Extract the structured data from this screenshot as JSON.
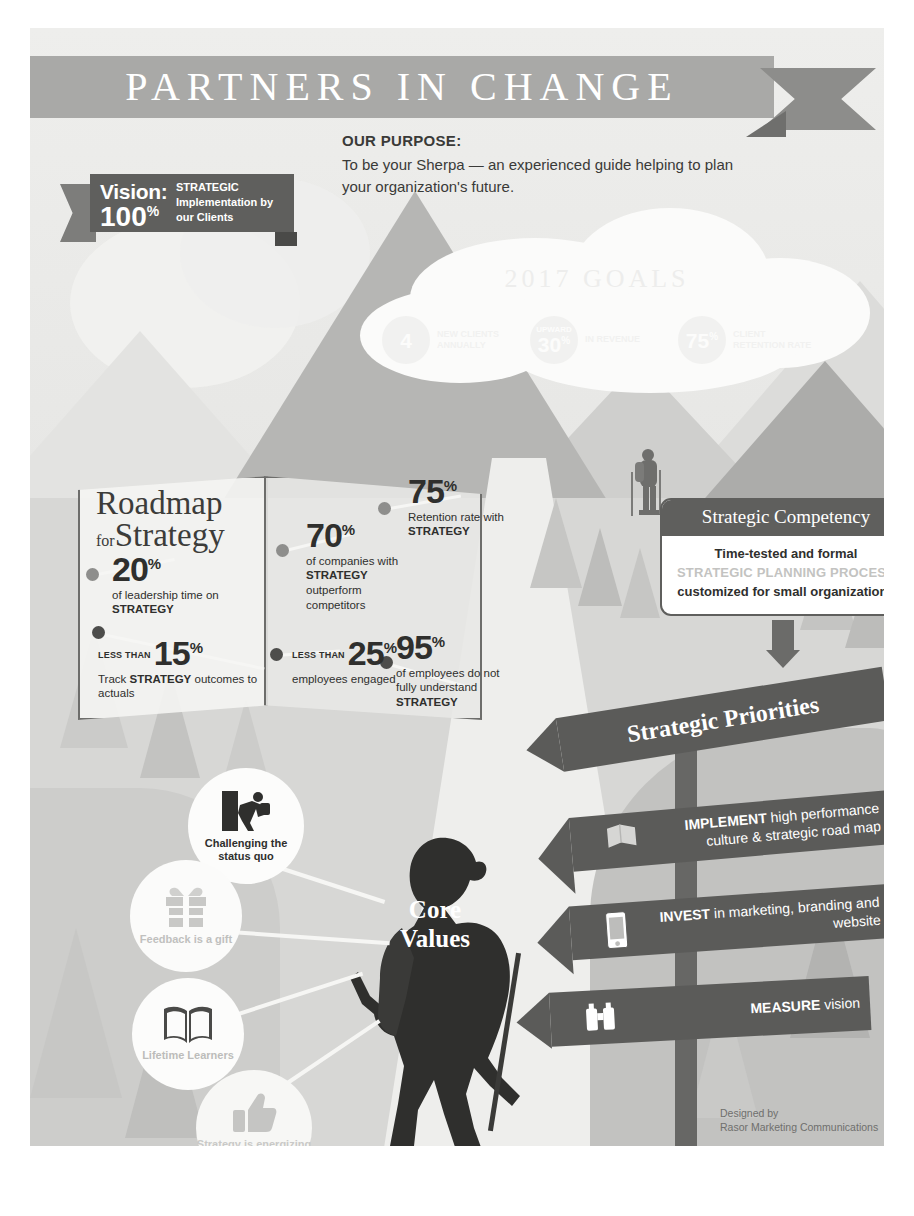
{
  "header": {
    "title": "PARTNERS IN CHANGE"
  },
  "purpose": {
    "title": "OUR PURPOSE:",
    "body": "To be your Sherpa — an experienced guide helping to plan your organization's future."
  },
  "vision": {
    "word": "Vision:",
    "number": "100",
    "unit": "%",
    "description": "STRATEGIC Implementation by our Clients"
  },
  "goals": {
    "title": "2017 GOALS",
    "items": [
      {
        "top": "",
        "number": "4",
        "unit": "",
        "text": "NEW CLIENTS ANNUALLY"
      },
      {
        "top": "UPWARD",
        "number": "30",
        "unit": "%",
        "text": "IN REVENUE"
      },
      {
        "top": "",
        "number": "75",
        "unit": "%",
        "text": "CLIENT RETENTION RATE"
      }
    ]
  },
  "roadmap": {
    "title_line1": "Roadmap",
    "title_small": "for",
    "title_line2": "Strategy",
    "stats": [
      {
        "prefix": "",
        "number": "20",
        "unit": "%",
        "caption_pre": "of leadership time on ",
        "caption_bold": "STRATEGY",
        "caption_post": ""
      },
      {
        "prefix": "",
        "number": "70",
        "unit": "%",
        "caption_pre": "of companies with ",
        "caption_bold": "STRATEGY",
        "caption_post": " outperform competitors"
      },
      {
        "prefix": "",
        "number": "75",
        "unit": "%",
        "caption_pre": "Retention rate with ",
        "caption_bold": "STRATEGY",
        "caption_post": ""
      },
      {
        "prefix": "LESS THAN",
        "number": "15",
        "unit": "%",
        "caption_pre": "Track ",
        "caption_bold": "STRATEGY",
        "caption_post": " outcomes to actuals"
      },
      {
        "prefix": "LESS THAN",
        "number": "25",
        "unit": "%",
        "caption_pre": "employees engaged",
        "caption_bold": "",
        "caption_post": ""
      },
      {
        "prefix": "",
        "number": "95",
        "unit": "%",
        "caption_pre": "of employees do not fully understand ",
        "caption_bold": "STRATEGY",
        "caption_post": ""
      }
    ]
  },
  "competency": {
    "heading": "Strategic Competency",
    "line1": "Time-tested and formal",
    "line2": "STRATEGIC PLANNING PROCESS",
    "line3": "customized for small organizations"
  },
  "priorities": {
    "title": "Strategic Priorities",
    "items": [
      {
        "icon": "flag-map-icon",
        "lead": "IMPLEMENT",
        "rest": " high performance culture & strategic road map"
      },
      {
        "icon": "mobile-phone-icon",
        "lead": "INVEST",
        "rest": " in marketing, branding and website"
      },
      {
        "icon": "binoculars-icon",
        "lead": "MEASURE",
        "rest": " vision"
      }
    ]
  },
  "core_values": {
    "title_line1": "Core",
    "title_line2": "Values",
    "items": [
      {
        "icon": "climber-icon",
        "label": "Challenging the status quo"
      },
      {
        "icon": "gift-box-icon",
        "label": "Feedback is a gift"
      },
      {
        "icon": "open-book-icon",
        "label": "Lifetime Learners"
      },
      {
        "icon": "thumbs-up-icon",
        "label": "Strategy is energizing and fun"
      }
    ]
  },
  "credit": {
    "line1": "Designed by",
    "line2": "Rasor Marketing Communications"
  },
  "colors": {
    "banner": "#a9a9a7",
    "banner_tail": "#8d8d8b",
    "dark_panel": "#5f5f5d",
    "sign": "#5b5b59",
    "text_dark": "#2f2f2d",
    "faded": "#c3c3c1"
  }
}
